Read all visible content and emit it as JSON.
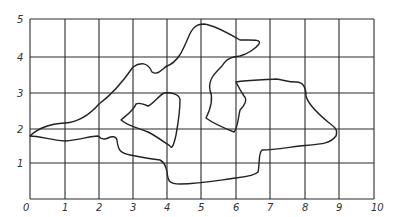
{
  "figure": {
    "x_axis": {
      "min": 0,
      "max": 10,
      "tick_labels": [
        "0",
        "1",
        "2",
        "3",
        "4",
        "5",
        "6",
        "7",
        "8",
        "9",
        "10"
      ],
      "tick_px": [
        30,
        65,
        99,
        133,
        167,
        201,
        236,
        270,
        305,
        339,
        374
      ]
    },
    "y_axis": {
      "min": 0,
      "max": 5,
      "tick_labels": [
        "1",
        "2",
        "3",
        "4",
        "5"
      ],
      "tick_px": [
        163,
        129,
        93,
        57,
        19
      ]
    },
    "grid": {
      "x_lines": 11,
      "y_lines": 6,
      "color": "#2a2a2a"
    },
    "shape": {
      "stroke_color": "#222222",
      "approx_vertices": [
        [
          0.0,
          1.8
        ],
        [
          0.3,
          2.1
        ],
        [
          1.0,
          2.2
        ],
        [
          1.5,
          2.5
        ],
        [
          2.0,
          2.9
        ],
        [
          2.7,
          3.5
        ],
        [
          3.0,
          3.8
        ],
        [
          3.3,
          3.6
        ],
        [
          3.5,
          3.4
        ],
        [
          4.0,
          3.7
        ],
        [
          4.4,
          4.3
        ],
        [
          4.8,
          4.8
        ],
        [
          5.3,
          4.7
        ],
        [
          6.0,
          4.5
        ],
        [
          6.7,
          4.5
        ],
        [
          6.2,
          4.1
        ],
        [
          5.6,
          3.9
        ],
        [
          5.2,
          3.2
        ],
        [
          5.5,
          2.5
        ],
        [
          5.3,
          2.2
        ],
        [
          6.0,
          1.9
        ],
        [
          6.1,
          2.4
        ],
        [
          6.3,
          2.8
        ],
        [
          6.0,
          3.3
        ],
        [
          7.5,
          3.4
        ],
        [
          8.0,
          3.3
        ],
        [
          8.1,
          2.9
        ],
        [
          8.9,
          2.0
        ],
        [
          8.6,
          1.7
        ],
        [
          7.0,
          1.4
        ],
        [
          6.8,
          1.3
        ],
        [
          6.7,
          0.6
        ],
        [
          5.0,
          0.4
        ],
        [
          3.9,
          0.5
        ],
        [
          3.9,
          1.0
        ],
        [
          2.6,
          1.1
        ],
        [
          2.5,
          1.5
        ],
        [
          2.0,
          1.5
        ],
        [
          1.0,
          1.6
        ],
        [
          0.0,
          1.8
        ]
      ],
      "inner_lobe": [
        [
          2.8,
          2.2
        ],
        [
          3.2,
          2.5
        ],
        [
          3.5,
          2.7
        ],
        [
          4.0,
          2.8
        ],
        [
          4.3,
          2.9
        ],
        [
          4.2,
          2.3
        ],
        [
          4.1,
          1.6
        ],
        [
          3.8,
          1.8
        ],
        [
          3.2,
          2.1
        ],
        [
          2.8,
          2.2
        ]
      ]
    }
  }
}
